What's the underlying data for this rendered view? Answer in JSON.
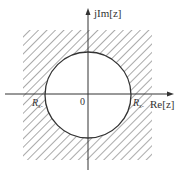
{
  "diagram": {
    "type": "z-plane region of convergence",
    "axes": {
      "real_label": "Re[z]",
      "imag_label": "jIm[z]",
      "origin_label": "0"
    },
    "circle": {
      "radius_label_left": "R",
      "radius_label_left_sub": "x-",
      "radius_label_right": "R",
      "radius_label_right_sub": "x-"
    },
    "region": {
      "description": "hatched area outside the circle (|z| > R)",
      "hatch": true
    },
    "colors": {
      "line": "#333333",
      "hatch": "#555555",
      "background": "#ffffff"
    }
  }
}
